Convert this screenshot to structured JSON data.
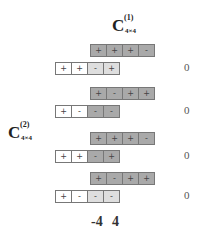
{
  "labels": {
    "c1": {
      "main": "C",
      "sup": "(1)",
      "sub": "4×4"
    },
    "c2": {
      "main": "C",
      "sup": "(2)",
      "sub": "4×4"
    }
  },
  "colors": {
    "dark": "#a9a9a9",
    "light": "#dedede",
    "white": "#ffffff",
    "border": "#777777"
  },
  "rows": [
    {
      "top": {
        "cells": [
          {
            "s": "+",
            "c": "dark"
          },
          {
            "s": "+",
            "c": "dark"
          },
          {
            "s": "+",
            "c": "dark"
          },
          {
            "s": "-",
            "c": "dark"
          }
        ]
      },
      "bottom": {
        "cells": [
          {
            "s": "+",
            "c": "white"
          },
          {
            "s": "+",
            "c": "white"
          },
          {
            "s": "-",
            "c": "light"
          },
          {
            "s": "+",
            "c": "light"
          }
        ]
      },
      "result": "0"
    },
    {
      "top": {
        "cells": [
          {
            "s": "+",
            "c": "dark"
          },
          {
            "s": "-",
            "c": "dark"
          },
          {
            "s": "+",
            "c": "dark"
          },
          {
            "s": "+",
            "c": "dark"
          }
        ]
      },
      "bottom": {
        "cells": [
          {
            "s": "+",
            "c": "white"
          },
          {
            "s": "-",
            "c": "white"
          },
          {
            "s": "-",
            "c": "dark"
          },
          {
            "s": "-",
            "c": "dark"
          }
        ]
      },
      "result": "0"
    },
    {
      "top": {
        "cells": [
          {
            "s": "+",
            "c": "dark"
          },
          {
            "s": "+",
            "c": "dark"
          },
          {
            "s": "+",
            "c": "dark"
          },
          {
            "s": "-",
            "c": "dark"
          }
        ]
      },
      "bottom": {
        "cells": [
          {
            "s": "+",
            "c": "white"
          },
          {
            "s": "+",
            "c": "white"
          },
          {
            "s": "-",
            "c": "dark"
          },
          {
            "s": "+",
            "c": "dark"
          }
        ]
      },
      "result": "0"
    },
    {
      "top": {
        "cells": [
          {
            "s": "+",
            "c": "dark"
          },
          {
            "s": "-",
            "c": "dark"
          },
          {
            "s": "+",
            "c": "dark"
          },
          {
            "s": "+",
            "c": "dark"
          }
        ]
      },
      "bottom": {
        "cells": [
          {
            "s": "+",
            "c": "white"
          },
          {
            "s": "-",
            "c": "white"
          },
          {
            "s": "-",
            "c": "light"
          },
          {
            "s": "-",
            "c": "light"
          }
        ]
      },
      "result": "0"
    }
  ],
  "shift_labels": {
    "left": "-4",
    "right": "4"
  }
}
